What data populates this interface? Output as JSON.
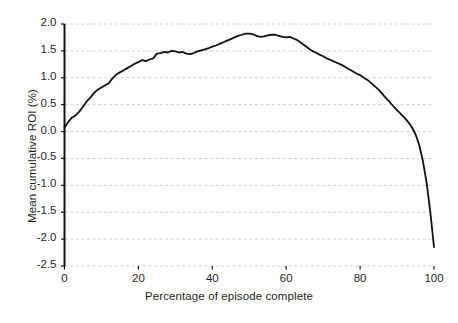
{
  "chart_data": {
    "type": "line",
    "title": "",
    "xlabel": "Percentage of episode complete",
    "ylabel": "Mean cumulative ROI (%)",
    "xlim": [
      0,
      100
    ],
    "ylim": [
      -2.5,
      2.0
    ],
    "xticks": [
      "0",
      "20",
      "40",
      "60",
      "80",
      "100"
    ],
    "xtick_values": [
      0,
      20,
      40,
      60,
      80,
      100
    ],
    "yticks": [
      "2.0",
      "1.5",
      "1.0",
      "0.5",
      "0.0",
      "-0.5",
      "-1.0",
      "-1.5",
      "-2.0",
      "-2.5"
    ],
    "ytick_values": [
      2.0,
      1.5,
      1.0,
      0.5,
      0.0,
      -0.5,
      -1.0,
      -1.5,
      -2.0,
      -2.5
    ],
    "grid": true,
    "grid_axis": "y",
    "grid_style": "dotted",
    "grid_color": "#c8c8c8",
    "legend": null,
    "line_color": "#111111",
    "line_width": 1.8,
    "series": [
      {
        "name": "Mean cumulative ROI",
        "x": [
          0,
          1,
          2,
          3,
          4,
          5,
          6,
          7,
          8,
          9,
          10,
          11,
          12,
          13,
          14,
          15,
          16,
          17,
          18,
          19,
          20,
          21,
          22,
          23,
          24,
          25,
          26,
          27,
          28,
          29,
          30,
          31,
          32,
          33,
          34,
          35,
          36,
          37,
          38,
          39,
          40,
          41,
          42,
          43,
          44,
          45,
          46,
          47,
          48,
          49,
          50,
          51,
          52,
          53,
          54,
          55,
          56,
          57,
          58,
          59,
          60,
          61,
          62,
          63,
          64,
          65,
          66,
          67,
          68,
          69,
          70,
          71,
          72,
          73,
          74,
          75,
          76,
          77,
          78,
          79,
          80,
          81,
          82,
          83,
          84,
          85,
          86,
          87,
          88,
          89,
          90,
          91,
          92,
          93,
          94,
          95,
          96,
          97,
          98,
          99,
          100
        ],
        "values": [
          0.07,
          0.18,
          0.26,
          0.3,
          0.37,
          0.46,
          0.56,
          0.63,
          0.72,
          0.78,
          0.82,
          0.86,
          0.9,
          0.99,
          1.06,
          1.1,
          1.14,
          1.18,
          1.22,
          1.26,
          1.29,
          1.33,
          1.31,
          1.34,
          1.36,
          1.45,
          1.46,
          1.48,
          1.47,
          1.5,
          1.49,
          1.47,
          1.48,
          1.45,
          1.44,
          1.46,
          1.49,
          1.51,
          1.53,
          1.55,
          1.58,
          1.6,
          1.63,
          1.66,
          1.69,
          1.72,
          1.75,
          1.78,
          1.8,
          1.82,
          1.82,
          1.81,
          1.78,
          1.76,
          1.77,
          1.79,
          1.8,
          1.8,
          1.78,
          1.76,
          1.75,
          1.76,
          1.73,
          1.7,
          1.65,
          1.6,
          1.55,
          1.5,
          1.47,
          1.43,
          1.4,
          1.36,
          1.33,
          1.3,
          1.27,
          1.24,
          1.2,
          1.16,
          1.12,
          1.08,
          1.05,
          1.0,
          0.96,
          0.9,
          0.84,
          0.78,
          0.7,
          0.62,
          0.55,
          0.47,
          0.4,
          0.33,
          0.26,
          0.18,
          0.08,
          -0.05,
          -0.25,
          -0.55,
          -0.95,
          -1.5,
          -2.15
        ]
      }
    ]
  }
}
